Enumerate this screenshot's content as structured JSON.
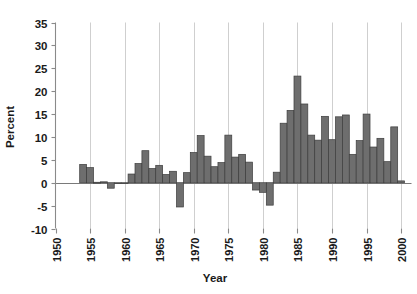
{
  "chart_data": {
    "type": "bar",
    "title": "",
    "xlabel": "Year",
    "ylabel": "Percent",
    "grid": "vertical gridlines at each 5-year x tick",
    "legend": "none",
    "xlim": [
      1950,
      2001.5
    ],
    "ylim": [
      -10,
      35
    ],
    "ytick_labels": [
      "35",
      "30",
      "25",
      "20",
      "15",
      "10",
      "5",
      "0",
      "-5",
      "-10"
    ],
    "yticks": [
      35,
      30,
      25,
      20,
      15,
      10,
      5,
      0,
      -5,
      -10
    ],
    "xtick_labels": [
      "1950",
      "1955",
      "1960",
      "1965",
      "1970",
      "1975",
      "1980",
      "1985",
      "1990",
      "1995",
      "2000"
    ],
    "xticks": [
      1950,
      1955,
      1960,
      1965,
      1970,
      1975,
      1980,
      1985,
      1990,
      1995,
      2000
    ],
    "bar_color": "#6e6e6e",
    "bar_edge_color": "#3d3d3d",
    "categories": [
      1954,
      1955,
      1956,
      1957,
      1958,
      1959,
      1960,
      1961,
      1962,
      1963,
      1964,
      1965,
      1966,
      1967,
      1968,
      1969,
      1970,
      1971,
      1972,
      1973,
      1974,
      1975,
      1976,
      1977,
      1978,
      1979,
      1980,
      1981,
      1982,
      1983,
      1984,
      1985,
      1986,
      1987,
      1988,
      1989,
      1990,
      1991,
      1992,
      1993,
      1994,
      1995,
      1996,
      1997,
      1998,
      1999,
      2000,
      2001
    ],
    "values": [
      4.0,
      3.3,
      0.1,
      0.2,
      -1.2,
      -0.2,
      -0.2,
      1.9,
      4.2,
      7.0,
      3.1,
      3.8,
      1.8,
      2.5,
      -5.3,
      2.2,
      6.6,
      10.3,
      5.8,
      3.5,
      4.4,
      10.4,
      5.6,
      6.2,
      4.5,
      -1.6,
      -2.1,
      -4.9,
      2.3,
      13.0,
      15.8,
      23.3,
      17.2,
      10.4,
      9.3,
      14.5,
      9.4,
      14.4,
      14.8,
      6.2,
      9.2,
      15.0,
      7.8,
      9.7,
      4.6,
      12.2,
      0.4,
      0.0
    ]
  }
}
